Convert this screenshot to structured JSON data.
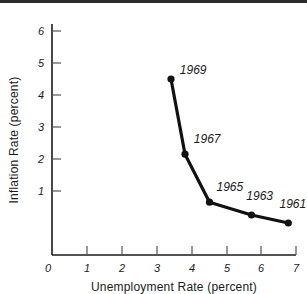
{
  "chart_data": {
    "type": "line",
    "title": "",
    "subtitle": "",
    "xlabel": "Unemployment Rate (percent)",
    "ylabel": "Inflation Rate (percent)",
    "xlim": [
      0,
      7
    ],
    "ylim": [
      0,
      6.3
    ],
    "xticks": [
      0,
      1,
      2,
      3,
      4,
      5,
      6,
      7
    ],
    "xtick_labels": [
      "0",
      "1",
      "2",
      "3",
      "4",
      "5",
      "6",
      "7"
    ],
    "yticks": [
      1,
      2,
      3,
      4,
      5,
      6
    ],
    "ytick_labels": [
      "1",
      "2",
      "3",
      "4",
      "5",
      "6"
    ],
    "grid": false,
    "legend": "none",
    "series": [
      {
        "name": "Phillips Curve (1961-1969)",
        "color": "#111111",
        "points": [
          {
            "label": "1969",
            "x": 3.4,
            "y": 5.5
          },
          {
            "label": "1967",
            "x": 3.8,
            "y": 3.15
          },
          {
            "label": "1965",
            "x": 4.5,
            "y": 1.65
          },
          {
            "label": "1963",
            "x": 5.7,
            "y": 1.25
          },
          {
            "label": "1961",
            "x": 6.75,
            "y": 1.0
          }
        ]
      }
    ],
    "annotations": [
      {
        "text": "1969",
        "x": 3.65,
        "y": 5.65
      },
      {
        "text": "1967",
        "x": 4.05,
        "y": 3.5
      },
      {
        "text": "1965",
        "x": 4.7,
        "y": 2.0
      },
      {
        "text": "1963",
        "x": 5.55,
        "y": 1.72
      },
      {
        "text": "1961",
        "x": 6.5,
        "y": 1.48
      }
    ]
  },
  "colors": {
    "axis": "#1a1a1a",
    "line": "#111111",
    "marker": "#111111",
    "background": "#ffffff",
    "top_band": "#2b2b2b"
  }
}
